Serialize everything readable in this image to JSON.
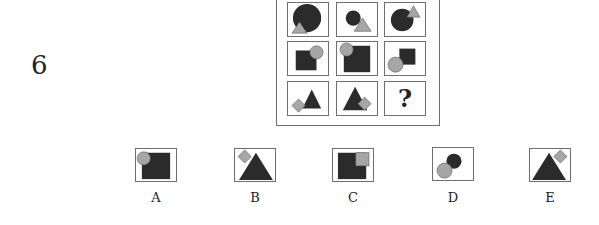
{
  "question": {
    "number": "6",
    "missing_cell_label": "?"
  },
  "grid": {
    "rows": [
      [
        {
          "shapes": "large dark circle with small grey triangle at bottom-left"
        },
        {
          "shapes": "small dark circle with grey triangle at bottom-right"
        },
        {
          "shapes": "dark circle with grey triangle at top-right"
        }
      ],
      [
        {
          "shapes": "dark square with grey circle at top-right"
        },
        {
          "shapes": "large dark square with grey circle at top-left"
        },
        {
          "shapes": "small dark square with grey circle at bottom-left"
        }
      ],
      [
        {
          "shapes": "dark triangle with grey diamond at bottom-left"
        },
        {
          "shapes": "dark triangle with grey diamond at bottom-right"
        },
        {
          "shapes": "missing"
        }
      ]
    ]
  },
  "options": [
    {
      "label": "A",
      "shapes": "dark square with grey circle at top-left"
    },
    {
      "label": "B",
      "shapes": "dark triangle with grey diamond at top-left"
    },
    {
      "label": "C",
      "shapes": "dark square with grey square at top-right"
    },
    {
      "label": "D",
      "shapes": "dark circle with grey circle at bottom-left"
    },
    {
      "label": "E",
      "shapes": "dark triangle with grey diamond at top-right"
    }
  ],
  "colors": {
    "dark_fill": "#2b2b2b",
    "grey_fill": "#a6a6a6",
    "border": "#6e6e6e"
  }
}
